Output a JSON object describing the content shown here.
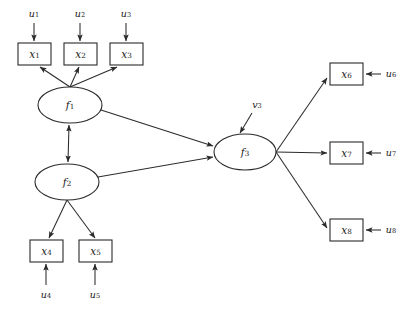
{
  "diagram": {
    "type": "structural-equation-model-path-diagram",
    "background_color": "#ffffff",
    "stroke_color": "#2b2b2b",
    "text_color": "#1a1a1a",
    "latent_variables": [
      {
        "id": "f1",
        "base": "f",
        "subscript": "1",
        "shape": "ellipse",
        "cx": 70,
        "cy": 105,
        "rx": 32,
        "ry": 18
      },
      {
        "id": "f2",
        "base": "f",
        "subscript": "2",
        "shape": "ellipse",
        "cx": 67,
        "cy": 182,
        "rx": 32,
        "ry": 18
      },
      {
        "id": "f3",
        "base": "f",
        "subscript": "3",
        "shape": "ellipse",
        "cx": 245,
        "cy": 152,
        "rx": 31,
        "ry": 18
      }
    ],
    "observed_variables": [
      {
        "id": "x1",
        "base": "x",
        "subscript": "1",
        "shape": "rect",
        "x": 18,
        "y": 43,
        "w": 33,
        "h": 22
      },
      {
        "id": "x2",
        "base": "x",
        "subscript": "2",
        "shape": "rect",
        "x": 64,
        "y": 43,
        "w": 33,
        "h": 22
      },
      {
        "id": "x3",
        "base": "x",
        "subscript": "3",
        "shape": "rect",
        "x": 110,
        "y": 43,
        "w": 33,
        "h": 22
      },
      {
        "id": "x4",
        "base": "x",
        "subscript": "4",
        "shape": "rect",
        "x": 30,
        "y": 240,
        "w": 33,
        "h": 22
      },
      {
        "id": "x5",
        "base": "x",
        "subscript": "5",
        "shape": "rect",
        "x": 79,
        "y": 240,
        "w": 33,
        "h": 22
      },
      {
        "id": "x6",
        "base": "x",
        "subscript": "6",
        "shape": "rect",
        "x": 330,
        "y": 63,
        "w": 33,
        "h": 22
      },
      {
        "id": "x7",
        "base": "x",
        "subscript": "7",
        "shape": "rect",
        "x": 330,
        "y": 142,
        "w": 33,
        "h": 22
      },
      {
        "id": "x8",
        "base": "x",
        "subscript": "8",
        "shape": "rect",
        "x": 330,
        "y": 219,
        "w": 33,
        "h": 22
      }
    ],
    "residual_terms": [
      {
        "id": "u1",
        "base": "u",
        "subscript": "1",
        "lx": 34,
        "ly": 14
      },
      {
        "id": "u2",
        "base": "u",
        "subscript": "2",
        "lx": 80,
        "ly": 14
      },
      {
        "id": "u3",
        "base": "u",
        "subscript": "3",
        "lx": 126,
        "ly": 14
      },
      {
        "id": "u4",
        "base": "u",
        "subscript": "4",
        "lx": 46,
        "ly": 295
      },
      {
        "id": "u5",
        "base": "u",
        "subscript": "5",
        "lx": 95,
        "ly": 295
      },
      {
        "id": "u6",
        "base": "u",
        "subscript": "6",
        "lx": 391,
        "ly": 74
      },
      {
        "id": "u7",
        "base": "u",
        "subscript": "7",
        "lx": 391,
        "ly": 153
      },
      {
        "id": "u8",
        "base": "u",
        "subscript": "8",
        "lx": 391,
        "ly": 230
      }
    ],
    "disturbance_terms": [
      {
        "id": "v3",
        "base": "v",
        "subscript": "3",
        "lx": 257,
        "ly": 105
      }
    ],
    "paths": [
      {
        "from": "f1",
        "to": "x1",
        "kind": "directed"
      },
      {
        "from": "f1",
        "to": "x2",
        "kind": "directed"
      },
      {
        "from": "f1",
        "to": "x3",
        "kind": "directed"
      },
      {
        "from": "f2",
        "to": "x4",
        "kind": "directed"
      },
      {
        "from": "f2",
        "to": "x5",
        "kind": "directed"
      },
      {
        "from": "f1",
        "to": "f2",
        "kind": "double-headed"
      },
      {
        "from": "f1",
        "to": "f3",
        "kind": "directed"
      },
      {
        "from": "f2",
        "to": "f3",
        "kind": "directed"
      },
      {
        "from": "f3",
        "to": "x6",
        "kind": "directed"
      },
      {
        "from": "f3",
        "to": "x7",
        "kind": "directed"
      },
      {
        "from": "f3",
        "to": "x8",
        "kind": "directed"
      },
      {
        "from": "u1",
        "to": "x1",
        "kind": "directed"
      },
      {
        "from": "u2",
        "to": "x2",
        "kind": "directed"
      },
      {
        "from": "u3",
        "to": "x3",
        "kind": "directed"
      },
      {
        "from": "u4",
        "to": "x4",
        "kind": "directed"
      },
      {
        "from": "u5",
        "to": "x5",
        "kind": "directed"
      },
      {
        "from": "u6",
        "to": "x6",
        "kind": "directed"
      },
      {
        "from": "u7",
        "to": "x7",
        "kind": "directed"
      },
      {
        "from": "u8",
        "to": "x8",
        "kind": "directed"
      },
      {
        "from": "v3",
        "to": "f3",
        "kind": "directed"
      }
    ]
  }
}
